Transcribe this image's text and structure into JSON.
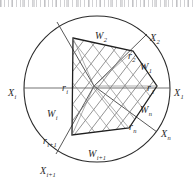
{
  "figure": {
    "caption": "",
    "kind": "geometric-partition-diagram",
    "colors": {
      "stroke": "#2b2b2b",
      "hatch": "#6b6b6b",
      "background": "#ffffff",
      "label": "#2b2b2b"
    }
  },
  "geometry": {
    "circle": {
      "cx": 97,
      "cy": 89,
      "r": 73
    },
    "center_point": {
      "x": 94,
      "y": 86
    },
    "polygon_vertices": [
      {
        "name": "vertex-top-left",
        "x": 73,
        "y": 38
      },
      {
        "name": "vertex-top-right",
        "x": 133,
        "y": 51
      },
      {
        "name": "vertex-right",
        "x": 157,
        "y": 86
      },
      {
        "name": "vertex-bottom-right",
        "x": 129,
        "y": 128
      },
      {
        "name": "vertex-bottom-left",
        "x": 72,
        "y": 135
      }
    ],
    "boundary_points": [
      {
        "name": "X1",
        "x": 170,
        "y": 88
      },
      {
        "name": "X2",
        "x": 147,
        "y": 34
      },
      {
        "name": "Xi",
        "x": 24,
        "y": 88
      },
      {
        "name": "Xi1",
        "x": 56,
        "y": 154
      },
      {
        "name": "Xn",
        "x": 157,
        "y": 132
      },
      {
        "name": "Xtop",
        "x": 57,
        "y": 22
      }
    ]
  },
  "labels": {
    "regions": [
      {
        "id": "W1",
        "base": "W",
        "sub": "1",
        "x": 140,
        "y": 57,
        "name": "region-label-w1"
      },
      {
        "id": "W2",
        "base": "W",
        "sub": "2",
        "x": 95,
        "y": 26,
        "name": "region-label-w2"
      },
      {
        "id": "Wi",
        "base": "W",
        "sub": "i",
        "x": 47,
        "y": 104,
        "name": "region-label-wi"
      },
      {
        "id": "Wi1",
        "base": "W",
        "sub": "i+1",
        "x": 88,
        "y": 144,
        "name": "region-label-wi1"
      },
      {
        "id": "Wn",
        "base": "W",
        "sub": "n",
        "x": 140,
        "y": 100,
        "name": "region-label-wn"
      }
    ],
    "radii": [
      {
        "id": "r1",
        "base": "r",
        "sub": "1",
        "x": 147,
        "y": 78,
        "name": "radius-label-r1"
      },
      {
        "id": "r2",
        "base": "r",
        "sub": "2",
        "x": 128,
        "y": 46,
        "name": "radius-label-r2"
      },
      {
        "id": "ri",
        "base": "r",
        "sub": "i",
        "x": 62,
        "y": 78,
        "name": "radius-label-ri"
      },
      {
        "id": "ri1",
        "base": "r",
        "sub": "i+1",
        "x": 43,
        "y": 131,
        "name": "radius-label-ri1"
      },
      {
        "id": "rn",
        "base": "r",
        "sub": "n",
        "x": 129,
        "y": 117,
        "name": "radius-label-rn"
      }
    ],
    "points": [
      {
        "id": "X1",
        "base": "X",
        "sub": "1",
        "x": 174,
        "y": 83,
        "name": "point-label-x1"
      },
      {
        "id": "X2",
        "base": "X",
        "sub": "2",
        "x": 150,
        "y": 28,
        "name": "point-label-x2"
      },
      {
        "id": "Xi",
        "base": "X",
        "sub": "i",
        "x": 8,
        "y": 83,
        "name": "point-label-xi"
      },
      {
        "id": "Xi1",
        "base": "X",
        "sub": "i+1",
        "x": 40,
        "y": 161,
        "name": "point-label-xi1"
      },
      {
        "id": "Xn",
        "base": "X",
        "sub": "n",
        "x": 161,
        "y": 124,
        "name": "point-label-xn"
      }
    ]
  }
}
